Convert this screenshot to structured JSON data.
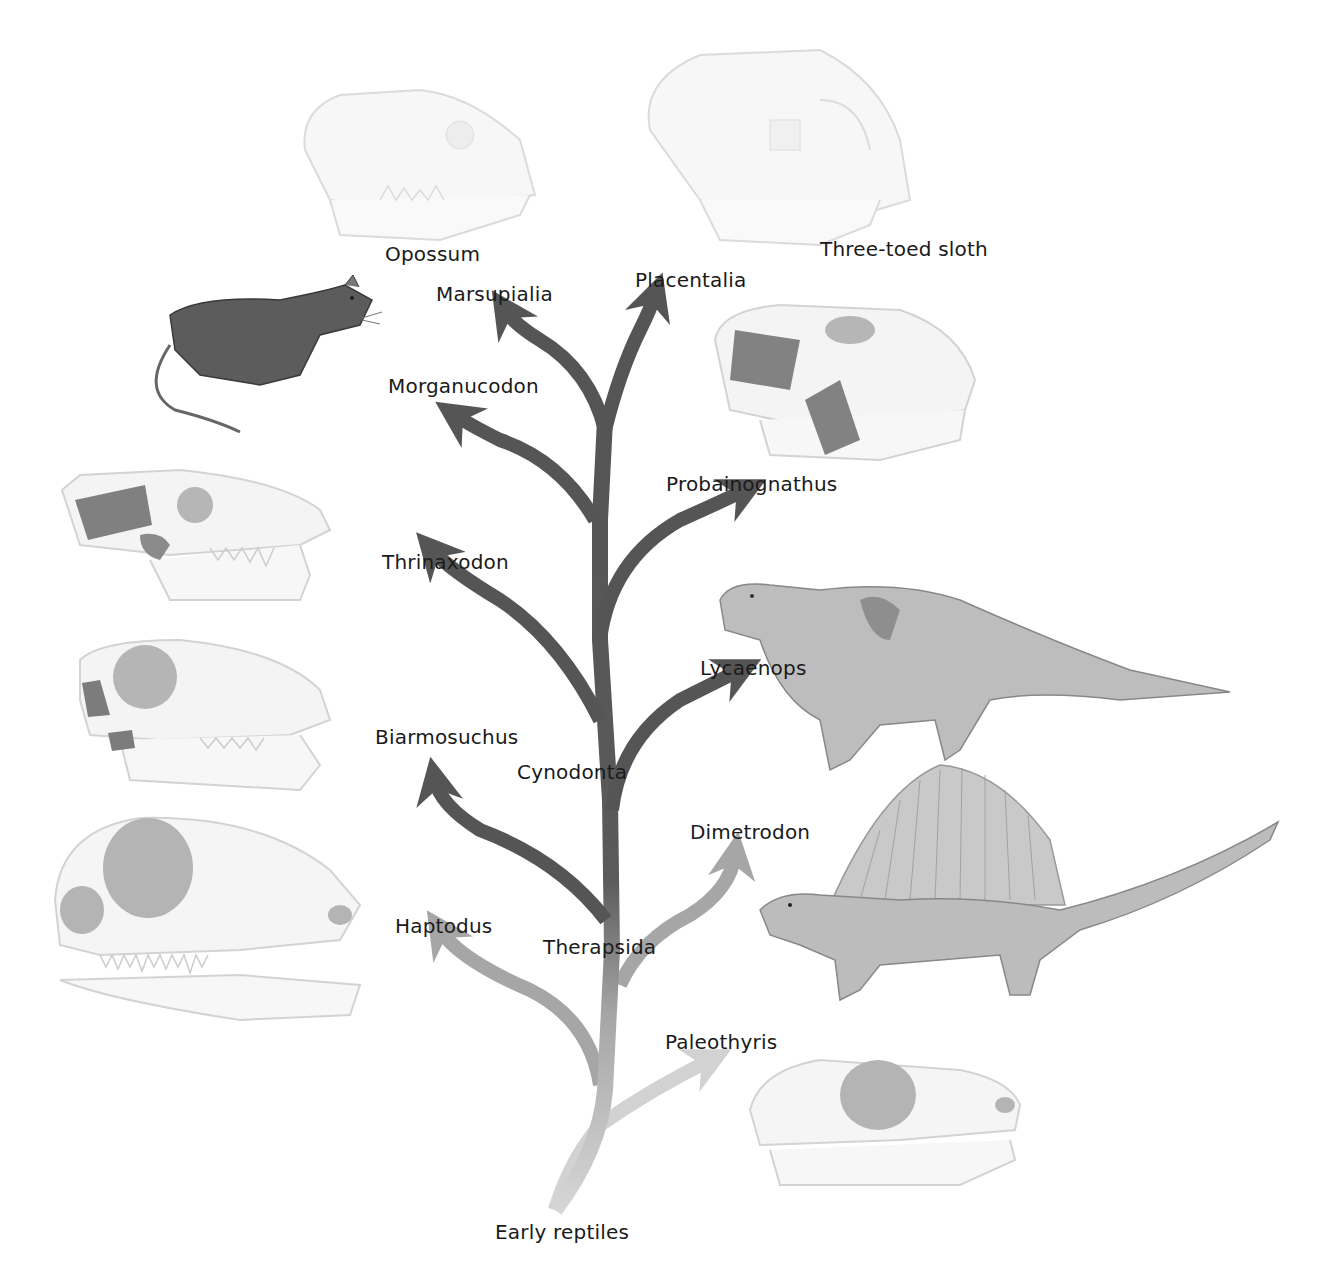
{
  "diagram": {
    "type": "phylogenetic-tree",
    "root_label": "Early reptiles",
    "colors": {
      "dark_branch": "#555555",
      "mid_branch": "#9a9a9a",
      "light_branch": "#cfcfcf",
      "skull_fill": "#f4f4f4",
      "skull_stroke": "#c8c8c8",
      "opening_fill": "#a8a8a8",
      "muscle_fill": "#6a6a6a",
      "morganucodon_fur": "#5a5a5a",
      "reptile_body": "#bdbdbd"
    },
    "nodes": {
      "therapsida": "Therapsida",
      "cynodonta": "Cynodonta"
    },
    "taxa": {
      "opossum": "Opossum",
      "three_toed_sloth": "Three-toed sloth",
      "marsupialia": "Marsupialia",
      "placentalia": "Placentalia",
      "morganucodon": "Morganucodon",
      "probainognathus": "Probainognathus",
      "thrinaxodon": "Thrinaxodon",
      "lycaenops": "Lycaenops",
      "biarmosuchus": "Biarmosuchus",
      "dimetrodon": "Dimetrodon",
      "haptodus": "Haptodus",
      "paleothyris": "Paleothyris",
      "early_reptiles": "Early reptiles"
    },
    "illustrations": [
      "opossum-skull",
      "sloth-skull",
      "morganucodon-animal",
      "probainognathus-skull",
      "thrinaxodon-skull",
      "biarmosuchus-skull",
      "haptodus-skull",
      "lycaenops-animal",
      "dimetrodon-animal",
      "paleothyris-skull"
    ]
  }
}
